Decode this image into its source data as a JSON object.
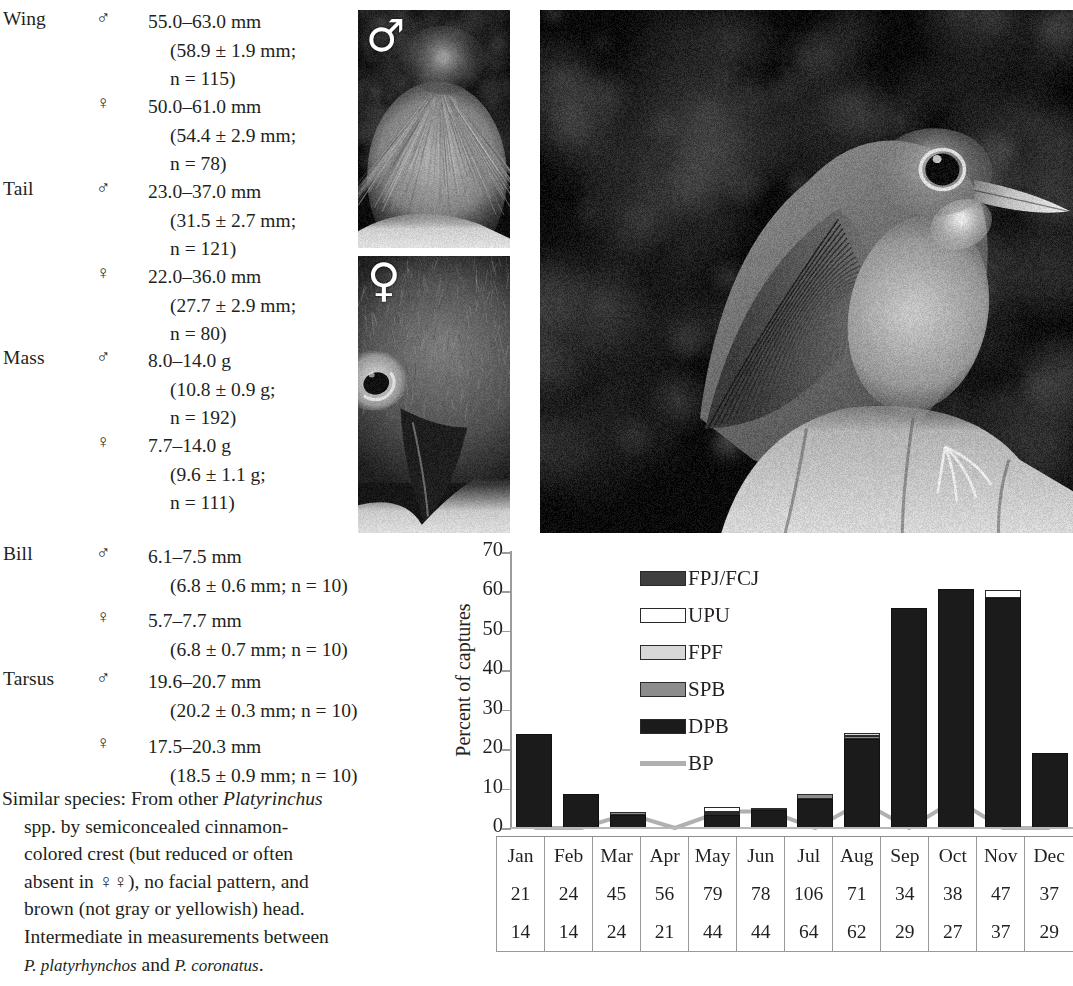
{
  "measurements": [
    {
      "label": "Wing",
      "entries": [
        {
          "sex": "♂",
          "line1": "55.0–63.0 mm",
          "line2": "(58.9 ± 1.9 mm;",
          "line3": "n = 115)"
        },
        {
          "sex": "♀",
          "line1": "50.0–61.0 mm",
          "line2": "(54.4 ± 2.9 mm;",
          "line3": "n = 78)"
        }
      ]
    },
    {
      "label": "Tail",
      "entries": [
        {
          "sex": "♂",
          "line1": "23.0–37.0 mm",
          "line2": "(31.5 ± 2.7 mm;",
          "line3": "n = 121)"
        },
        {
          "sex": "♀",
          "line1": "22.0–36.0 mm",
          "line2": "(27.7 ± 2.9 mm;",
          "line3": "n = 80)"
        }
      ]
    },
    {
      "label": "Mass",
      "entries": [
        {
          "sex": "♂",
          "line1": "8.0–14.0 g",
          "line2": "(10.8 ± 0.9 g;",
          "line3": "n = 192)"
        },
        {
          "sex": "♀",
          "line1": "7.7–14.0 g",
          "line2": "(9.6 ± 1.1 g;",
          "line3": "n = 111)"
        }
      ]
    },
    {
      "label": "Bill",
      "entries": [
        {
          "sex": "♂",
          "line1": "6.1–7.5 mm",
          "line2": "(6.8 ± 0.6 mm; n = 10)",
          "line3": ""
        },
        {
          "sex": "♀",
          "line1": "5.7–7.7 mm",
          "line2": "(6.8 ± 0.7 mm; n = 10)",
          "line3": ""
        }
      ]
    },
    {
      "label": "Tarsus",
      "entries": [
        {
          "sex": "♂",
          "line1": "19.6–20.7 mm",
          "line2": "(20.2 ± 0.3 mm; n = 10)",
          "line3": ""
        },
        {
          "sex": "♀",
          "line1": "17.5–20.3 mm",
          "line2": "(18.5 ± 0.9 mm; n = 10)",
          "line3": ""
        }
      ]
    }
  ],
  "similar_species": {
    "line1_plain": "Similar species: From other ",
    "line1_italic": "Platyrinchus",
    "line2": "spp. by semiconcealed cinnamon-",
    "line3": "colored crest (but reduced or often",
    "line4": "absent in ♀♀), no facial pattern, and",
    "line5": "brown (not gray or yellowish) head.",
    "line6": "Intermediate in measurements between",
    "line7_italic_a": "P. platyrhynchos",
    "line7_plain": " and ",
    "line7_italic_b": "P. coronatus",
    "line7_end": "."
  },
  "photos": {
    "male": {
      "caption_symbol": "♂",
      "alt": "male crown with semiconcealed cinnamon crest"
    },
    "female": {
      "caption_symbol": "♀",
      "alt": "female head and broad flat bill"
    },
    "main": {
      "alt": "Platyrinchus perched on hand, lateral view"
    }
  },
  "chart_data": {
    "type": "bar",
    "stacked": true,
    "title": "",
    "xlabel": "",
    "ylabel": "Percent of captures",
    "ylim": [
      0,
      70
    ],
    "yticks": [
      0,
      10,
      20,
      30,
      40,
      50,
      60,
      70
    ],
    "grid": false,
    "legend_position": "inside-upper-left",
    "categories": [
      "Jan",
      "Feb",
      "Mar",
      "Apr",
      "May",
      "Jun",
      "Jul",
      "Aug",
      "Sep",
      "Oct",
      "Nov",
      "Dec"
    ],
    "series": [
      {
        "name": "DPB",
        "color": "#1b1b1b",
        "values": [
          23.8,
          8.6,
          3.2,
          0.0,
          3.2,
          4.6,
          7.4,
          22.6,
          55.8,
          60.5,
          58.4,
          19.0
        ]
      },
      {
        "name": "SPB",
        "color": "#8c8c8c",
        "values": [
          0.0,
          0.0,
          0.9,
          0.0,
          0.5,
          0.4,
          1.2,
          0.7,
          0.0,
          0.0,
          0.0,
          0.0
        ]
      },
      {
        "name": "FPF",
        "color": "#d8d8d8",
        "values": [
          0.0,
          0.0,
          0.0,
          0.0,
          0.4,
          0.0,
          0.0,
          0.7,
          0.0,
          0.0,
          0.0,
          0.0
        ]
      },
      {
        "name": "UPU",
        "color": "#ffffff",
        "values": [
          0.0,
          0.0,
          0.0,
          0.0,
          1.3,
          0.0,
          0.0,
          0.0,
          0.0,
          0.0,
          2.0,
          0.0
        ]
      },
      {
        "name": "FPJ/FCJ",
        "color": "#3f3f3f",
        "values": [
          0.0,
          0.0,
          0.0,
          0.0,
          0.0,
          0.0,
          0.0,
          0.0,
          0.0,
          0.0,
          0.0,
          0.0
        ]
      }
    ],
    "line_series": {
      "name": "BP",
      "color": "#b0b0b0",
      "values": [
        0.0,
        0.0,
        3.6,
        0.0,
        4.2,
        4.2,
        0.0,
        6.6,
        0.0,
        7.2,
        0.0,
        0.0
      ]
    },
    "legend": [
      {
        "label": "FPJ/FCJ",
        "swatch": "#3f3f3f",
        "type": "box"
      },
      {
        "label": "UPU",
        "swatch": "#ffffff",
        "type": "box"
      },
      {
        "label": "FPF",
        "swatch": "#d8d8d8",
        "type": "box"
      },
      {
        "label": "SPB",
        "swatch": "#8c8c8c",
        "type": "box"
      },
      {
        "label": "DPB",
        "swatch": "#1b1b1b",
        "type": "box"
      },
      {
        "label": "BP",
        "swatch": "#b0b0b0",
        "type": "line"
      }
    ]
  },
  "month_table": {
    "rows": [
      {
        "name": "months",
        "cells": [
          "Jan",
          "Feb",
          "Mar",
          "Apr",
          "May",
          "Jun",
          "Jul",
          "Aug",
          "Sep",
          "Oct",
          "Nov",
          "Dec"
        ]
      },
      {
        "name": "captures",
        "cells": [
          "21",
          "24",
          "45",
          "56",
          "79",
          "78",
          "106",
          "71",
          "34",
          "38",
          "47",
          "37"
        ]
      },
      {
        "name": "individuals",
        "cells": [
          "14",
          "14",
          "24",
          "21",
          "44",
          "44",
          "64",
          "62",
          "29",
          "27",
          "37",
          "29"
        ]
      }
    ]
  }
}
